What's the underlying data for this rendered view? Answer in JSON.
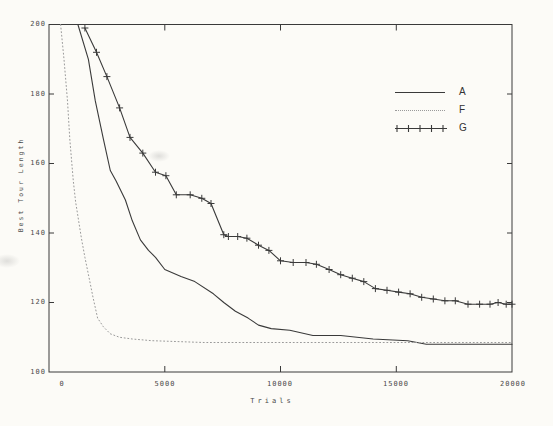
{
  "figure": {
    "background": "#fcfbf7",
    "ink": "#3a3a3a",
    "muted_ink": "#9a9a9a",
    "label_ink": "#4a4a4a"
  },
  "chart_data": {
    "type": "line",
    "title": "",
    "xlabel": "Trials",
    "ylabel": "Best Tour Length",
    "xlim": [
      0,
      20000
    ],
    "ylim": [
      100,
      200
    ],
    "grid": false,
    "x_ticks": [
      0,
      5000,
      10000,
      15000,
      20000
    ],
    "x_tick_labels": [
      "0",
      "5000",
      "10000",
      "15000",
      "20000"
    ],
    "y_ticks": [
      100,
      120,
      140,
      160,
      180,
      200
    ],
    "y_tick_labels_top_to_bottom": [
      "200",
      "180",
      "160",
      "140",
      "120",
      "100"
    ],
    "legend": {
      "position": "upper-right",
      "entries": [
        "A",
        "F",
        "G"
      ]
    },
    "series": [
      {
        "name": "A",
        "style": "solid",
        "marker": "none",
        "color": "#3a3a3a",
        "points": [
          [
            1250,
            200
          ],
          [
            1700,
            190
          ],
          [
            2000,
            178
          ],
          [
            2350,
            167
          ],
          [
            2650,
            158
          ],
          [
            2900,
            155
          ],
          [
            3300,
            149.5
          ],
          [
            3600,
            143.5
          ],
          [
            3950,
            138
          ],
          [
            4300,
            135
          ],
          [
            4600,
            133
          ],
          [
            5000,
            129.5
          ],
          [
            5700,
            127.5
          ],
          [
            6300,
            126
          ],
          [
            7100,
            122.5
          ],
          [
            7550,
            120
          ],
          [
            8050,
            117.5
          ],
          [
            8600,
            115.5
          ],
          [
            9050,
            113.5
          ],
          [
            9600,
            112.5
          ],
          [
            10400,
            112
          ],
          [
            11400,
            110.5
          ],
          [
            12600,
            110.5
          ],
          [
            14000,
            109.5
          ],
          [
            15500,
            109
          ],
          [
            16300,
            108
          ],
          [
            20000,
            108
          ]
        ]
      },
      {
        "name": "F",
        "style": "dotted",
        "marker": "none",
        "color": "#9a9a9a",
        "points": [
          [
            500,
            200
          ],
          [
            650,
            190
          ],
          [
            800,
            178
          ],
          [
            900,
            167
          ],
          [
            1050,
            155
          ],
          [
            1150,
            149
          ],
          [
            1400,
            138.5
          ],
          [
            1550,
            133
          ],
          [
            1750,
            126.5
          ],
          [
            1900,
            121.5
          ],
          [
            2100,
            115.5
          ],
          [
            2350,
            113
          ],
          [
            2650,
            111
          ],
          [
            3050,
            110
          ],
          [
            3600,
            109.5
          ],
          [
            4450,
            109
          ],
          [
            6700,
            108.5
          ],
          [
            20000,
            108.5
          ]
        ]
      },
      {
        "name": "G",
        "style": "solid",
        "marker": "+",
        "color": "#3a3a3a",
        "points": [
          [
            1550,
            199
          ],
          [
            2050,
            192
          ],
          [
            2500,
            185
          ],
          [
            3050,
            176
          ],
          [
            3500,
            167.5
          ],
          [
            4050,
            163
          ],
          [
            4600,
            157.5
          ],
          [
            5050,
            156.5
          ],
          [
            5500,
            151
          ],
          [
            6100,
            151
          ],
          [
            6600,
            150
          ],
          [
            7000,
            148.5
          ],
          [
            7550,
            139.5
          ],
          [
            7750,
            139
          ],
          [
            8150,
            139
          ],
          [
            8550,
            138.5
          ],
          [
            9050,
            136.5
          ],
          [
            9500,
            135
          ],
          [
            10000,
            132
          ],
          [
            10550,
            131.5
          ],
          [
            11100,
            131.5
          ],
          [
            11550,
            131
          ],
          [
            12100,
            129.5
          ],
          [
            12600,
            128
          ],
          [
            13100,
            127
          ],
          [
            13600,
            126
          ],
          [
            14100,
            124
          ],
          [
            14600,
            123.5
          ],
          [
            15100,
            123
          ],
          [
            15600,
            122.5
          ],
          [
            16100,
            121.5
          ],
          [
            16600,
            121
          ],
          [
            17100,
            120.5
          ],
          [
            17550,
            120.5
          ],
          [
            18100,
            119.5
          ],
          [
            18600,
            119.5
          ],
          [
            19050,
            119.5
          ],
          [
            19400,
            120
          ],
          [
            19750,
            119.5
          ],
          [
            20000,
            119.5
          ]
        ]
      }
    ],
    "plot_box_px": {
      "left": 49,
      "top": 24.5,
      "right": 512,
      "bottom": 372
    }
  }
}
